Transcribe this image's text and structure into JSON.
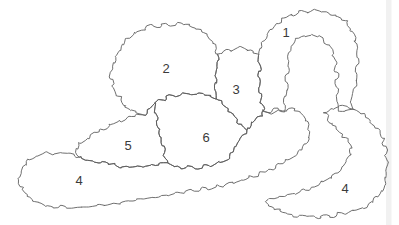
{
  "figure": {
    "type": "hand-drawn-region-map",
    "canvas": {
      "width": 399,
      "height": 225,
      "background": "#ffffff"
    },
    "style": {
      "stroke_color": "#5f5f5f",
      "stroke_width": 0.9,
      "label_color": "#3a3a3a",
      "label_font_size": 13,
      "scan_edge_color": "#f1f1f1"
    },
    "regions": [
      {
        "id": "1",
        "label": "1",
        "label_x": 286,
        "label_y": 33,
        "shape_hint": "arch-band",
        "outline": [
          [
            264,
            112
          ],
          [
            261,
            100
          ],
          [
            259,
            84
          ],
          [
            260,
            68
          ],
          [
            258,
            55
          ],
          [
            261,
            43
          ],
          [
            268,
            32
          ],
          [
            278,
            23
          ],
          [
            290,
            15
          ],
          [
            304,
            11
          ],
          [
            319,
            11
          ],
          [
            334,
            14
          ],
          [
            346,
            22
          ],
          [
            353,
            33
          ],
          [
            357,
            47
          ],
          [
            358,
            62
          ],
          [
            356,
            79
          ],
          [
            353,
            95
          ],
          [
            351,
            110
          ],
          [
            338,
            111
          ],
          [
            337,
            94
          ],
          [
            337,
            77
          ],
          [
            335,
            60
          ],
          [
            330,
            46
          ],
          [
            321,
            37
          ],
          [
            308,
            34
          ],
          [
            297,
            39
          ],
          [
            291,
            50
          ],
          [
            288,
            64
          ],
          [
            287,
            82
          ],
          [
            286,
            98
          ],
          [
            284,
            110
          ],
          [
            274,
            112
          ]
        ]
      },
      {
        "id": "2",
        "label": "2",
        "label_x": 166,
        "label_y": 69,
        "shape_hint": "large-blob",
        "outline": [
          [
            163,
            25
          ],
          [
            178,
            24
          ],
          [
            193,
            26
          ],
          [
            205,
            33
          ],
          [
            213,
            42
          ],
          [
            218,
            55
          ],
          [
            217,
            68
          ],
          [
            215,
            84
          ],
          [
            216,
            97
          ],
          [
            204,
            95
          ],
          [
            188,
            93
          ],
          [
            170,
            96
          ],
          [
            154,
            103
          ],
          [
            146,
            115
          ],
          [
            137,
            114
          ],
          [
            126,
            107
          ],
          [
            118,
            97
          ],
          [
            112,
            85
          ],
          [
            111,
            71
          ],
          [
            115,
            56
          ],
          [
            123,
            43
          ],
          [
            135,
            33
          ],
          [
            148,
            27
          ]
        ]
      },
      {
        "id": "3",
        "label": "3",
        "label_x": 236,
        "label_y": 90,
        "shape_hint": "blob",
        "outline": [
          [
            218,
            55
          ],
          [
            228,
            50
          ],
          [
            239,
            48
          ],
          [
            250,
            50
          ],
          [
            258,
            55
          ],
          [
            260,
            68
          ],
          [
            259,
            84
          ],
          [
            261,
            100
          ],
          [
            264,
            112
          ],
          [
            259,
            117
          ],
          [
            252,
            123
          ],
          [
            246,
            130
          ],
          [
            238,
            121
          ],
          [
            230,
            112
          ],
          [
            223,
            104
          ],
          [
            216,
            97
          ],
          [
            215,
            84
          ],
          [
            217,
            68
          ]
        ]
      },
      {
        "id": "4a",
        "label": "4",
        "label_x": 79,
        "label_y": 181,
        "shape_hint": "long-band-with-upturned-tail",
        "outline": [
          [
            18,
            179
          ],
          [
            22,
            168
          ],
          [
            30,
            159
          ],
          [
            42,
            154
          ],
          [
            56,
            153
          ],
          [
            68,
            154
          ],
          [
            79,
            156
          ],
          [
            94,
            161
          ],
          [
            111,
            165
          ],
          [
            130,
            167
          ],
          [
            149,
            166
          ],
          [
            166,
            162
          ],
          [
            179,
            167
          ],
          [
            196,
            168
          ],
          [
            213,
            165
          ],
          [
            228,
            159
          ],
          [
            234,
            150
          ],
          [
            240,
            139
          ],
          [
            246,
            130
          ],
          [
            252,
            123
          ],
          [
            259,
            117
          ],
          [
            264,
            113
          ],
          [
            273,
            110
          ],
          [
            283,
            109
          ],
          [
            293,
            110
          ],
          [
            301,
            114
          ],
          [
            307,
            121
          ],
          [
            310,
            130
          ],
          [
            308,
            140
          ],
          [
            302,
            149
          ],
          [
            294,
            156
          ],
          [
            284,
            162
          ],
          [
            271,
            169
          ],
          [
            254,
            176
          ],
          [
            235,
            182
          ],
          [
            214,
            187
          ],
          [
            191,
            191
          ],
          [
            167,
            195
          ],
          [
            143,
            199
          ],
          [
            119,
            203
          ],
          [
            95,
            206
          ],
          [
            71,
            208
          ],
          [
            50,
            206
          ],
          [
            34,
            200
          ],
          [
            23,
            191
          ]
        ]
      },
      {
        "id": "5",
        "label": "5",
        "label_x": 128,
        "label_y": 146,
        "shape_hint": "blob",
        "outline": [
          [
            79,
            144
          ],
          [
            94,
            134
          ],
          [
            110,
            125
          ],
          [
            127,
            118
          ],
          [
            138,
            115
          ],
          [
            146,
            115
          ],
          [
            154,
            103
          ],
          [
            157,
            120
          ],
          [
            160,
            136
          ],
          [
            164,
            150
          ],
          [
            166,
            162
          ],
          [
            149,
            166
          ],
          [
            130,
            167
          ],
          [
            111,
            165
          ],
          [
            94,
            161
          ],
          [
            79,
            156
          ],
          [
            76,
            150
          ]
        ]
      },
      {
        "id": "6",
        "label": "6",
        "label_x": 206,
        "label_y": 138,
        "shape_hint": "blob",
        "outline": [
          [
            154,
            103
          ],
          [
            170,
            96
          ],
          [
            188,
            93
          ],
          [
            204,
            95
          ],
          [
            216,
            97
          ],
          [
            223,
            104
          ],
          [
            230,
            112
          ],
          [
            238,
            121
          ],
          [
            246,
            130
          ],
          [
            240,
            139
          ],
          [
            234,
            150
          ],
          [
            228,
            159
          ],
          [
            213,
            165
          ],
          [
            196,
            168
          ],
          [
            179,
            167
          ],
          [
            166,
            162
          ],
          [
            164,
            150
          ],
          [
            160,
            136
          ],
          [
            157,
            120
          ]
        ]
      },
      {
        "id": "4b",
        "label": "4",
        "label_x": 345,
        "label_y": 189,
        "shape_hint": "hook-crescent-band",
        "outline": [
          [
            325,
            113
          ],
          [
            336,
            107
          ],
          [
            348,
            106
          ],
          [
            358,
            112
          ],
          [
            368,
            119
          ],
          [
            377,
            128
          ],
          [
            383,
            139
          ],
          [
            386,
            152
          ],
          [
            387,
            165
          ],
          [
            386,
            177
          ],
          [
            383,
            189
          ],
          [
            377,
            198
          ],
          [
            367,
            206
          ],
          [
            353,
            211
          ],
          [
            337,
            215
          ],
          [
            318,
            217
          ],
          [
            299,
            216
          ],
          [
            282,
            212
          ],
          [
            269,
            206
          ],
          [
            265,
            201
          ],
          [
            276,
            198
          ],
          [
            291,
            195
          ],
          [
            306,
            190
          ],
          [
            321,
            183
          ],
          [
            334,
            175
          ],
          [
            344,
            166
          ],
          [
            351,
            156
          ],
          [
            351,
            146
          ],
          [
            345,
            137
          ],
          [
            337,
            129
          ],
          [
            329,
            121
          ]
        ]
      }
    ]
  }
}
